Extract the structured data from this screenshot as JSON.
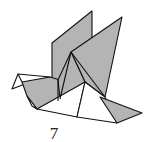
{
  "diagram": {
    "step_number": "7",
    "colors": {
      "paper_colored": "#b4b4b4",
      "paper_white": "#ffffff",
      "line": "#111111"
    }
  }
}
